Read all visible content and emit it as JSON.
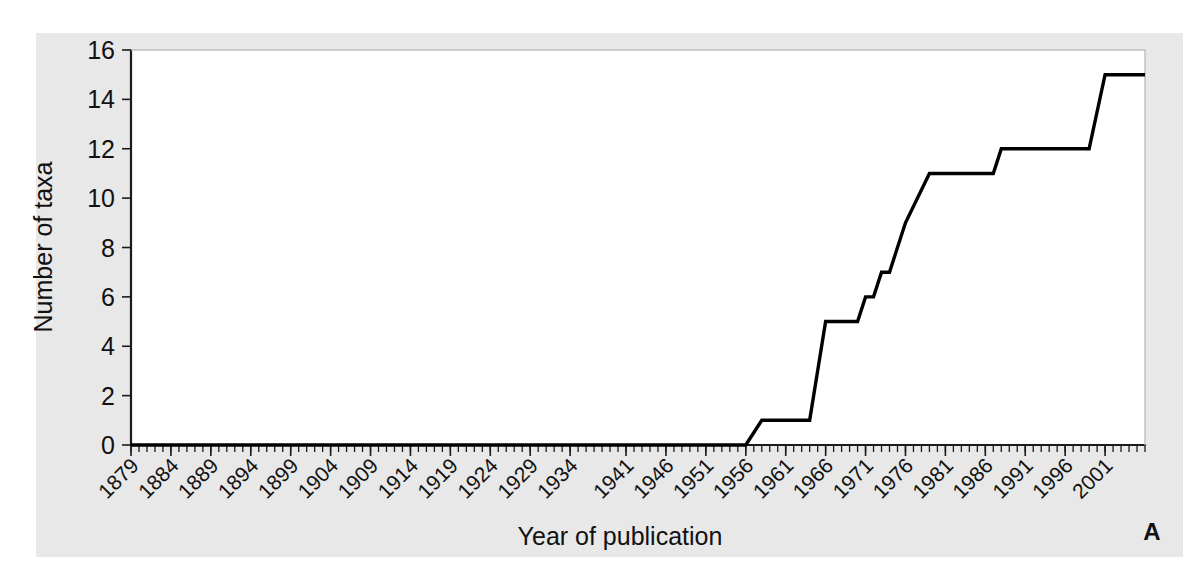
{
  "figure": {
    "panel_label": "A",
    "background_color": "#e8e8e8",
    "plot_background_color": "#ffffff",
    "line_color": "#000000",
    "axis_color": "#1a1a1a"
  },
  "chart_data": {
    "type": "line",
    "title": "",
    "subtitle": "",
    "xlabel": "Year of publication",
    "ylabel": "Number of taxa",
    "style": "step",
    "grid": false,
    "legend": null,
    "xlim": [
      1879,
      2006
    ],
    "ylim": [
      0,
      16
    ],
    "ytick_labels": [
      "0",
      "2",
      "4",
      "6",
      "8",
      "10",
      "12",
      "14",
      "16"
    ],
    "ytick_values": [
      0,
      2,
      4,
      6,
      8,
      10,
      12,
      14,
      16
    ],
    "xtick_labels": [
      "1879",
      "1884",
      "1889",
      "1894",
      "1899",
      "1904",
      "1909",
      "1914",
      "1919",
      "1924",
      "1929",
      "1934",
      "1941",
      "1946",
      "1951",
      "1956",
      "1961",
      "1966",
      "1971",
      "1976",
      "1981",
      "1986",
      "1991",
      "1996",
      "2001"
    ],
    "xtick_values": [
      1879,
      1884,
      1889,
      1894,
      1899,
      1904,
      1909,
      1914,
      1919,
      1924,
      1929,
      1934,
      1941,
      1946,
      1951,
      1956,
      1961,
      1966,
      1971,
      1976,
      1981,
      1986,
      1991,
      1996,
      2001
    ],
    "x_minor_tick_interval": 1,
    "series": [
      {
        "name": "Cumulative number of taxa",
        "x": [
          1879,
          1956,
          1958,
          1964,
          1966,
          1970,
          1971,
          1972,
          1973,
          1974,
          1976,
          1979,
          1987,
          1988,
          1999,
          2001,
          2006
        ],
        "values": [
          0,
          0,
          1,
          1,
          5,
          5,
          6,
          6,
          7,
          7,
          9,
          11,
          11,
          12,
          12,
          15,
          15
        ]
      }
    ],
    "annotations": [
      {
        "text": "A",
        "position": "bottom-right"
      }
    ]
  }
}
